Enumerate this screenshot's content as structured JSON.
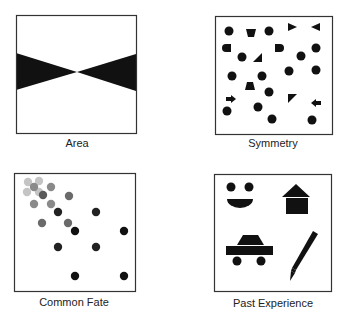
{
  "panels": [
    {
      "id": "area",
      "label": "Area",
      "box": {
        "x": 16,
        "y": 15,
        "w": 120,
        "h": 118
      },
      "shapes": [
        {
          "type": "polygon",
          "points": "16,53 77,72 16,90",
          "fill": "#111111"
        },
        {
          "type": "polygon",
          "points": "136,54 77,72 136,91",
          "fill": "#111111"
        }
      ]
    },
    {
      "id": "symmetry",
      "label": "Symmetry",
      "box": {
        "x": 215,
        "y": 16,
        "w": 117,
        "h": 118
      },
      "shapes": [
        {
          "type": "circle",
          "cx": 229,
          "cy": 31,
          "r": 4.5
        },
        {
          "type": "polygon",
          "points": "246,29 256,29 254,37 248,37"
        },
        {
          "type": "circle",
          "cx": 269,
          "cy": 31,
          "r": 4.5
        },
        {
          "type": "polygon",
          "points": "288,23 297,27 288,31"
        },
        {
          "type": "polygon",
          "points": "320,23 311,27 320,31"
        },
        {
          "type": "path",
          "d": "M231,44 L231,52 L226,52 A4,4 0 0 1 226,44 Z"
        },
        {
          "type": "circle",
          "cx": 242,
          "cy": 57,
          "r": 4.5
        },
        {
          "type": "polygon",
          "points": "262,53 262,62 253,62"
        },
        {
          "type": "path",
          "d": "M275,44 L275,52 L280,52 A4,4 0 0 0 280,44 Z"
        },
        {
          "type": "circle",
          "cx": 301,
          "cy": 56,
          "r": 4.5
        },
        {
          "type": "circle",
          "cx": 316,
          "cy": 48,
          "r": 4.5
        },
        {
          "type": "circle",
          "cx": 232,
          "cy": 76,
          "r": 4.5
        },
        {
          "type": "circle",
          "cx": 262,
          "cy": 76,
          "r": 4.5
        },
        {
          "type": "circle",
          "cx": 289,
          "cy": 71,
          "r": 4.5
        },
        {
          "type": "circle",
          "cx": 316,
          "cy": 70,
          "r": 4.5
        },
        {
          "type": "polygon",
          "points": "247,82 253,82 255,90 245,90"
        },
        {
          "type": "circle",
          "cx": 269,
          "cy": 92,
          "r": 4.5
        },
        {
          "type": "polygon",
          "points": "226,97 231,97 231,95 236,99 231,103 231,101 226,101"
        },
        {
          "type": "polygon",
          "points": "288,94 297,94 288,103"
        },
        {
          "type": "polygon",
          "points": "321,101 316,101 316,99 311,103 316,107 316,105 321,105"
        },
        {
          "type": "circle",
          "cx": 227,
          "cy": 111,
          "r": 4.5
        },
        {
          "type": "circle",
          "cx": 258,
          "cy": 107,
          "r": 4.5
        },
        {
          "type": "circle",
          "cx": 272,
          "cy": 119,
          "r": 4.5
        },
        {
          "type": "circle",
          "cx": 312,
          "cy": 120,
          "r": 4.5
        }
      ]
    },
    {
      "id": "common-fate",
      "label": "Common Fate",
      "box": {
        "x": 14,
        "y": 173,
        "w": 121,
        "h": 118
      },
      "shapes": [
        {
          "type": "circle",
          "cx": 28,
          "cy": 182,
          "r": 4.2,
          "fill": "#c4c4c4"
        },
        {
          "type": "circle",
          "cx": 39,
          "cy": 181,
          "r": 4.2,
          "fill": "#c4c4c4"
        },
        {
          "type": "circle",
          "cx": 27,
          "cy": 192,
          "r": 4.2,
          "fill": "#c4c4c4"
        },
        {
          "type": "circle",
          "cx": 39,
          "cy": 192,
          "r": 4.2,
          "fill": "#c4c4c4"
        },
        {
          "type": "circle",
          "cx": 34,
          "cy": 187,
          "r": 4.2,
          "fill": "#8a8a8a"
        },
        {
          "type": "circle",
          "cx": 51,
          "cy": 187,
          "r": 4.2,
          "fill": "#8a8a8a"
        },
        {
          "type": "circle",
          "cx": 43,
          "cy": 195,
          "r": 4.2,
          "fill": "#5a5a5a"
        },
        {
          "type": "circle",
          "cx": 69,
          "cy": 196,
          "r": 4.2,
          "fill": "#6a6a6a"
        },
        {
          "type": "circle",
          "cx": 34,
          "cy": 204,
          "r": 4.2,
          "fill": "#8a8a8a"
        },
        {
          "type": "circle",
          "cx": 51,
          "cy": 204,
          "r": 4.2,
          "fill": "#8a8a8a"
        },
        {
          "type": "circle",
          "cx": 58,
          "cy": 212,
          "r": 4.2,
          "fill": "#222222"
        },
        {
          "type": "circle",
          "cx": 96,
          "cy": 212,
          "r": 4.2,
          "fill": "#222222"
        },
        {
          "type": "circle",
          "cx": 42,
          "cy": 223,
          "r": 4.2,
          "fill": "#6a6a6a"
        },
        {
          "type": "circle",
          "cx": 68,
          "cy": 223,
          "r": 4.2,
          "fill": "#6a6a6a"
        },
        {
          "type": "circle",
          "cx": 75,
          "cy": 231,
          "r": 4.2,
          "fill": "#111111"
        },
        {
          "type": "circle",
          "cx": 124,
          "cy": 231,
          "r": 4.2,
          "fill": "#111111"
        },
        {
          "type": "circle",
          "cx": 58,
          "cy": 247,
          "r": 4.2,
          "fill": "#222222"
        },
        {
          "type": "circle",
          "cx": 96,
          "cy": 247,
          "r": 4.2,
          "fill": "#222222"
        },
        {
          "type": "circle",
          "cx": 75,
          "cy": 276,
          "r": 4.2,
          "fill": "#111111"
        },
        {
          "type": "circle",
          "cx": 124,
          "cy": 276,
          "r": 4.2,
          "fill": "#111111"
        }
      ]
    },
    {
      "id": "past-experience",
      "label": "Past Experience",
      "box": {
        "x": 214,
        "y": 174,
        "w": 117,
        "h": 117
      },
      "shapes": [
        {
          "type": "circle",
          "cx": 231,
          "cy": 187,
          "r": 4.5
        },
        {
          "type": "circle",
          "cx": 249,
          "cy": 187,
          "r": 4.5
        },
        {
          "type": "path",
          "d": "M227,199 L253,199 A13,9 0 0 1 227,199 Z"
        },
        {
          "type": "polygon",
          "points": "296,184 310,197 282,197"
        },
        {
          "type": "rect",
          "x": 286,
          "y": 198,
          "w": 22,
          "h": 16
        },
        {
          "type": "polygon",
          "points": "243,235 258,235 264,245 237,245"
        },
        {
          "type": "rect",
          "x": 226,
          "y": 246,
          "w": 47,
          "h": 9
        },
        {
          "type": "circle",
          "cx": 237,
          "cy": 261,
          "r": 4.5
        },
        {
          "type": "circle",
          "cx": 261,
          "cy": 261,
          "r": 4.5
        },
        {
          "type": "polygon",
          "points": "313,231 318,234 296,270 292,268"
        },
        {
          "type": "polygon",
          "points": "292,268 296,270 295,273 291,271"
        },
        {
          "type": "polygon",
          "points": "291,271 295,273 290,281"
        }
      ]
    }
  ]
}
